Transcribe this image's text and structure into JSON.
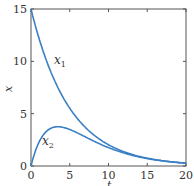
{
  "chart_data": {
    "type": "line",
    "title": "",
    "xlabel": "t",
    "ylabel": "x",
    "xlim": [
      0,
      20
    ],
    "ylim": [
      0,
      15
    ],
    "xticks": [
      0,
      5,
      10,
      15,
      20
    ],
    "yticks": [
      0,
      5,
      10,
      15
    ],
    "grid": false,
    "series": [
      {
        "name": "x1",
        "label": "x_1",
        "x": [
          0,
          1,
          2,
          3,
          4,
          5,
          6,
          8,
          10,
          12,
          14,
          16,
          18,
          20
        ],
        "values": [
          15,
          12.28,
          10.05,
          8.23,
          6.74,
          5.52,
          4.52,
          3.03,
          2.03,
          1.36,
          0.91,
          0.61,
          0.41,
          0.27
        ]
      },
      {
        "name": "x2",
        "label": "x_2",
        "x": [
          0,
          1,
          2,
          3,
          4,
          5,
          6,
          8,
          10,
          12,
          14,
          16,
          18,
          20
        ],
        "values": [
          0,
          2.23,
          3.32,
          3.72,
          3.72,
          3.49,
          3.16,
          2.45,
          1.78,
          1.24,
          0.86,
          0.58,
          0.39,
          0.27
        ]
      }
    ],
    "annotations": [
      {
        "text": "x1",
        "x": 5,
        "y": 10
      },
      {
        "text": "x2",
        "x": 2,
        "y": 2
      }
    ]
  },
  "labels": {
    "x1": "x",
    "x1_sub": "1",
    "x2": "x",
    "x2_sub": "2",
    "xlabel": "t",
    "ylabel": "x",
    "xticks": [
      "0",
      "5",
      "10",
      "15",
      "20"
    ],
    "yticks": [
      "0",
      "5",
      "10",
      "15"
    ]
  },
  "colors": {
    "curve": "#3a7fc4",
    "axis": "#555555"
  }
}
